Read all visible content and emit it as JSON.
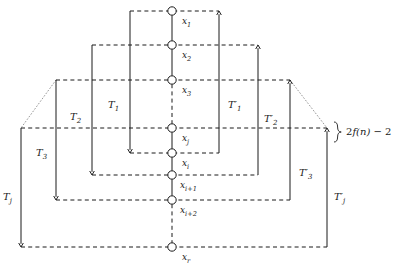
{
  "figure": {
    "background_color": "#ffffff",
    "ink_color": "#1a1a1a",
    "dotted_color": "#9a9a9a"
  },
  "nodes": [
    {
      "id": "x1",
      "label": "x",
      "sub": "1",
      "cx": 172,
      "cy": 11,
      "label_x": 182,
      "label_y": 17
    },
    {
      "id": "x2",
      "label": "x",
      "sub": "2",
      "cx": 172,
      "cy": 45,
      "label_x": 182,
      "label_y": 51
    },
    {
      "id": "x3",
      "label": "x",
      "sub": "3",
      "cx": 172,
      "cy": 80,
      "label_x": 182,
      "label_y": 86
    },
    {
      "id": "xj",
      "label": "x",
      "sub": "j",
      "cx": 172,
      "cy": 128,
      "label_x": 182,
      "label_y": 134
    },
    {
      "id": "xi",
      "label": "x",
      "sub": "i",
      "cx": 172,
      "cy": 153,
      "label_x": 182,
      "label_y": 159
    },
    {
      "id": "xi1",
      "label": "x",
      "sub": "i+1",
      "cx": 172,
      "cy": 175,
      "label_x": 180,
      "label_y": 181
    },
    {
      "id": "xi2",
      "label": "x",
      "sub": "i+2",
      "cx": 172,
      "cy": 200,
      "label_x": 180,
      "label_y": 206
    },
    {
      "id": "xr",
      "label": "x",
      "sub": "r",
      "cx": 172,
      "cy": 247,
      "label_x": 182,
      "label_y": 253
    }
  ],
  "spine_segments": [
    {
      "style": "solid",
      "y1": 11,
      "y2": 45
    },
    {
      "style": "solid",
      "y1": 45,
      "y2": 80
    },
    {
      "style": "dashed",
      "y1": 80,
      "y2": 128
    },
    {
      "style": "solid",
      "y1": 128,
      "y2": 153
    },
    {
      "style": "solid",
      "y1": 153,
      "y2": 175
    },
    {
      "style": "solid",
      "y1": 175,
      "y2": 200
    },
    {
      "style": "dashed",
      "y1": 200,
      "y2": 247
    }
  ],
  "left_trees": [
    {
      "id": "T1",
      "label": "T",
      "sub": "1",
      "prime": "",
      "x": 130,
      "y_top": 11,
      "y_bottom": 153,
      "dash_top_x2": 219,
      "dash_bottom_x2": 219,
      "label_x": 108,
      "label_y": 100
    },
    {
      "id": "T2",
      "label": "T",
      "sub": "2",
      "prime": "",
      "x": 92,
      "y_top": 45,
      "y_bottom": 175,
      "dash_top_x2": 258,
      "dash_bottom_x2": 258,
      "label_x": 70,
      "label_y": 112
    },
    {
      "id": "T3",
      "label": "T",
      "sub": "3",
      "prime": "",
      "x": 56,
      "y_top": 80,
      "y_bottom": 200,
      "dash_top_x2": 290,
      "dash_bottom_x2": 290,
      "label_x": 36,
      "label_y": 148
    },
    {
      "id": "Tj",
      "label": "T",
      "sub": "j",
      "prime": "",
      "x": 21,
      "y_top": 128,
      "y_bottom": 247,
      "dash_top_x2": 327,
      "dash_bottom_x2": 327,
      "label_x": 3,
      "label_y": 192
    }
  ],
  "right_trees": [
    {
      "id": "T1p",
      "label": "T",
      "sub": "1",
      "prime": "′",
      "x": 219,
      "y_top": 11,
      "y_bottom": 153,
      "label_x": 228,
      "label_y": 100
    },
    {
      "id": "T2p",
      "label": "T",
      "sub": "2",
      "prime": "′",
      "x": 258,
      "y_top": 45,
      "y_bottom": 175,
      "label_x": 264,
      "label_y": 114
    },
    {
      "id": "T3p",
      "label": "T",
      "sub": "3",
      "prime": "′",
      "x": 290,
      "y_top": 80,
      "y_bottom": 200,
      "label_x": 299,
      "label_y": 168
    },
    {
      "id": "Tjp",
      "label": "T",
      "sub": "j",
      "prime": "′",
      "x": 327,
      "y_top": 128,
      "y_bottom": 247,
      "label_x": 334,
      "label_y": 192
    }
  ],
  "dotted_continuations": [
    {
      "id": "left-upper",
      "x1": 56,
      "y1": 80,
      "x2": 21,
      "y2": 128
    },
    {
      "id": "right-upper",
      "x1": 290,
      "y1": 80,
      "x2": 327,
      "y2": 128
    }
  ],
  "annotation": {
    "id": "range-brace",
    "text_prefix": "2",
    "text_function": "f",
    "text_arg": "(n)",
    "text_suffix": " − 2",
    "full_text": "2f(n) − 2",
    "brace_x": 334,
    "brace_y_top": 122,
    "brace_y_bottom": 142,
    "label_x": 346,
    "label_y": 127
  }
}
